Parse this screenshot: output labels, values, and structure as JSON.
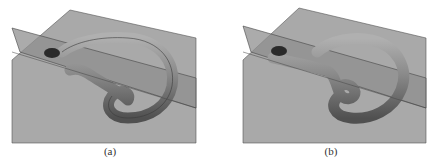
{
  "figure": {
    "panels": [
      {
        "id": "a",
        "caption": "(a)",
        "description": "Tube surface looping around, intersecting a tilted translucent plane; tube end pokes out at left"
      },
      {
        "id": "b",
        "caption": "(b)",
        "description": "Same tube surface with a straightened tail lying along the plane intersection"
      }
    ],
    "colors": {
      "background": "#ffffff",
      "base_plane": "#a9a9a9",
      "tilted_plane": "#8f8f8f",
      "tube": "#7d7d7d",
      "tube_highlight": "#b4b4b4",
      "tube_shadow": "#4a4a4a",
      "edge": "#3a3a3a"
    }
  }
}
